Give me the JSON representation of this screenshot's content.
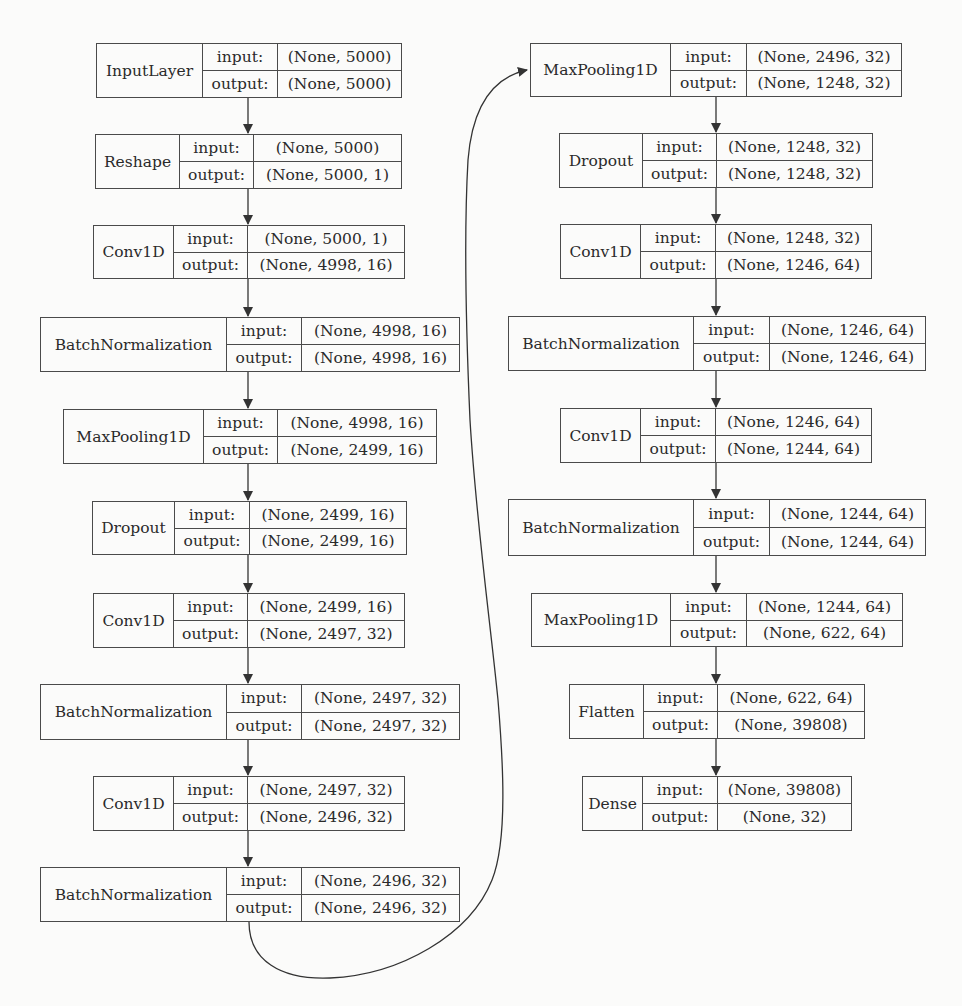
{
  "diagram": {
    "type": "neural-network-architecture",
    "input_label": "input:",
    "output_label": "output:",
    "left_column": [
      {
        "id": "L1",
        "name": "InputLayer",
        "input": "(None, 5000)",
        "output": "(None, 5000)",
        "box": [
          96,
          43,
          402,
          98
        ],
        "div": [
          202,
          277
        ]
      },
      {
        "id": "L2",
        "name": "Reshape",
        "input": "(None, 5000)",
        "output": "(None, 5000, 1)",
        "box": [
          95,
          134,
          402,
          189
        ],
        "div": [
          179,
          253
        ]
      },
      {
        "id": "L3",
        "name": "Conv1D",
        "input": "(None, 5000, 1)",
        "output": "(None, 4998, 16)",
        "box": [
          93,
          225,
          405,
          279
        ],
        "div": [
          173,
          247
        ]
      },
      {
        "id": "L4",
        "name": "BatchNormalization",
        "input": "(None, 4998, 16)",
        "output": "(None, 4998, 16)",
        "box": [
          40,
          317,
          460,
          372
        ],
        "div": [
          226,
          301
        ]
      },
      {
        "id": "L5",
        "name": "MaxPooling1D",
        "input": "(None, 4998, 16)",
        "output": "(None, 2499, 16)",
        "box": [
          63,
          409,
          437,
          464
        ],
        "div": [
          203,
          277
        ]
      },
      {
        "id": "L6",
        "name": "Dropout",
        "input": "(None, 2499, 16)",
        "output": "(None, 2499, 16)",
        "box": [
          92,
          501,
          407,
          555
        ],
        "div": [
          174,
          249
        ]
      },
      {
        "id": "L7",
        "name": "Conv1D",
        "input": "(None, 2499, 16)",
        "output": "(None, 2497, 32)",
        "box": [
          93,
          593,
          405,
          648
        ],
        "div": [
          173,
          247
        ]
      },
      {
        "id": "L8",
        "name": "BatchNormalization",
        "input": "(None, 2497, 32)",
        "output": "(None, 2497, 32)",
        "box": [
          40,
          684,
          460,
          740
        ],
        "div": [
          226,
          301
        ]
      },
      {
        "id": "L9",
        "name": "Conv1D",
        "input": "(None, 2497, 32)",
        "output": "(None, 2496, 32)",
        "box": [
          93,
          776,
          405,
          831
        ],
        "div": [
          173,
          247
        ]
      },
      {
        "id": "L10",
        "name": "BatchNormalization",
        "input": "(None, 2496, 32)",
        "output": "(None, 2496, 32)",
        "box": [
          40,
          867,
          460,
          922
        ],
        "div": [
          226,
          301
        ]
      }
    ],
    "right_column": [
      {
        "id": "R1",
        "name": "MaxPooling1D",
        "input": "(None, 2496, 32)",
        "output": "(None, 1248, 32)",
        "box": [
          530,
          43,
          902,
          97
        ],
        "div": [
          670,
          746
        ]
      },
      {
        "id": "R2",
        "name": "Dropout",
        "input": "(None, 1248, 32)",
        "output": "(None, 1248, 32)",
        "box": [
          559,
          133,
          873,
          188
        ],
        "div": [
          642,
          716
        ]
      },
      {
        "id": "R3",
        "name": "Conv1D",
        "input": "(None, 1248, 32)",
        "output": "(None, 1246, 64)",
        "box": [
          560,
          224,
          872,
          279
        ],
        "div": [
          640,
          715
        ]
      },
      {
        "id": "R4",
        "name": "BatchNormalization",
        "input": "(None, 1246, 64)",
        "output": "(None, 1246, 64)",
        "box": [
          508,
          316,
          926,
          371
        ],
        "div": [
          693,
          769
        ]
      },
      {
        "id": "R5",
        "name": "Conv1D",
        "input": "(None, 1246, 64)",
        "output": "(None, 1244, 64)",
        "box": [
          560,
          408,
          872,
          463
        ],
        "div": [
          640,
          715
        ]
      },
      {
        "id": "R6",
        "name": "BatchNormalization",
        "input": "(None, 1244, 64)",
        "output": "(None, 1244, 64)",
        "box": [
          508,
          499,
          926,
          556
        ],
        "div": [
          693,
          769
        ]
      },
      {
        "id": "R7",
        "name": "MaxPooling1D",
        "input": "(None, 1244, 64)",
        "output": "(None, 622, 64)",
        "box": [
          531,
          593,
          903,
          647
        ],
        "div": [
          670,
          746
        ]
      },
      {
        "id": "R8",
        "name": "Flatten",
        "input": "(None, 622, 64)",
        "output": "(None, 39808)",
        "box": [
          569,
          684,
          865,
          739
        ],
        "div": [
          643,
          717
        ]
      },
      {
        "id": "R9",
        "name": "Dense",
        "input": "(None, 39808)",
        "output": "(None, 32)",
        "box": [
          582,
          776,
          852,
          831
        ],
        "div": [
          642,
          717
        ]
      }
    ],
    "edges": {
      "left_x": 248,
      "right_x": 716,
      "wrap_edge": {
        "from": "L10",
        "to": "R1"
      }
    },
    "colors": {
      "background": "#fbfbfa",
      "stroke": "#4a4a4a",
      "text": "#2a2a2a"
    }
  }
}
